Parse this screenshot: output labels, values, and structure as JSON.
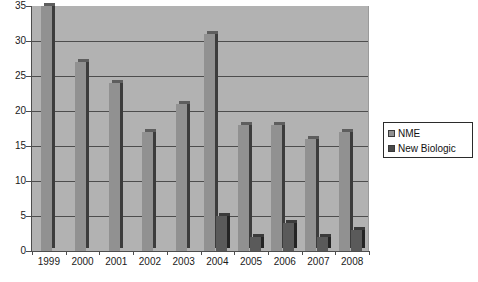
{
  "chart_data": {
    "type": "bar",
    "title": "",
    "subtitle": "",
    "xlabel": "",
    "ylabel": "",
    "categories": [
      "1999",
      "2000",
      "2001",
      "2002",
      "2003",
      "2004",
      "2005",
      "2006",
      "2007",
      "2008"
    ],
    "series": [
      {
        "name": "NME",
        "color": "#919191",
        "values": [
          35,
          27,
          24,
          17,
          21,
          31,
          18,
          18,
          16,
          17
        ]
      },
      {
        "name": "New Biologic",
        "color": "#4a4a4a",
        "values": [
          0,
          0,
          0,
          0,
          0,
          5,
          2,
          4,
          2,
          3
        ]
      }
    ],
    "ylim": [
      0,
      35
    ],
    "yticks": [
      0,
      5,
      10,
      15,
      20,
      25,
      30,
      35
    ],
    "ytick_labels": [
      "0",
      "5",
      "10",
      "15",
      "20",
      "25",
      "30",
      "35"
    ],
    "grid": true,
    "grid_axis": "y",
    "legend_position": "right",
    "plot_background": "#b2b2b2",
    "figure_background": "#ffffff"
  },
  "legend": {
    "entries": [
      {
        "label": "NME",
        "swatch": "legend-swatch-nme"
      },
      {
        "label": "New Biologic",
        "swatch": "legend-swatch-new-biologic"
      }
    ]
  }
}
